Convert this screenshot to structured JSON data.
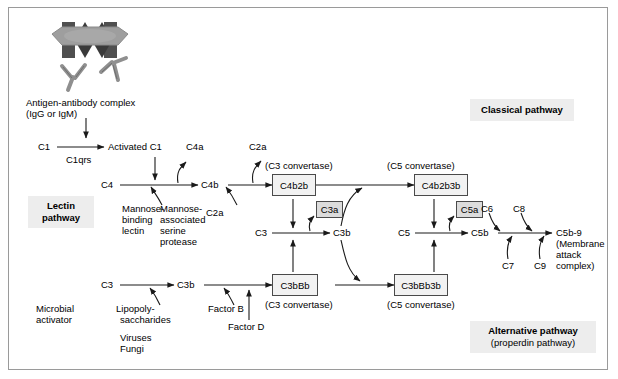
{
  "illustration": {
    "antigen_label": "antigen-bar",
    "antibody_label": "antibody-y-shape"
  },
  "classical": {
    "antigen_complex_line1": "Antigen-antibody complex",
    "antigen_complex_line2": "(IgG or IgM)",
    "c1": "C1",
    "c1qrs": "C1qrs",
    "activated_c1": "Activated C1",
    "c4": "C4",
    "c4a": "C4a",
    "c4b": "C4b",
    "c2a_up": "C2a",
    "c2a_in": "C2a",
    "c3_convertase_caption": "(C3 convertase)",
    "c4b2b": "C4b2b",
    "c5_convertase_caption": "(C5 convertase)",
    "c4b2b3b": "C4b2b3b",
    "pathway_label": "Classical pathway"
  },
  "lectin": {
    "pathway_line1": "Lectin",
    "pathway_line2": "pathway",
    "mbl_line1": "Mannose-",
    "mbl_line2": "binding",
    "mbl_line3": "lectin",
    "masp_line1": "Mannose-",
    "masp_line2": "associated",
    "masp_line3": "serine",
    "masp_line4": "protease"
  },
  "alternative": {
    "c3": "C3",
    "c3b": "C3b",
    "microbial_line1": "Microbial",
    "microbial_line2": "activator",
    "lps_line1": "Lipopoly-",
    "lps_line2": "saccharides",
    "viruses": "Viruses",
    "fungi": "Fungi",
    "factor_b": "Factor B",
    "factor_d": "Factor D",
    "c3bbb": "C3bBb",
    "c3_convertase_caption": "(C3 convertase)",
    "c3bbb3b": "C3bBb3b",
    "c5_convertase_caption": "(C5 convertase)",
    "pathway_line1": "Alternative pathway",
    "pathway_line2": "(properdin pathway)"
  },
  "central": {
    "c3": "C3",
    "c3a": "C3a",
    "c3b": "C3b",
    "c5": "C5",
    "c5a": "C5a",
    "c5b": "C5b"
  },
  "terminal": {
    "c6": "C6",
    "c7": "C7",
    "c8": "C8",
    "c9": "C9",
    "mac_line1": "C5b-9",
    "mac_line2": "(Membrane",
    "mac_line3": "attack",
    "mac_line4": "complex)"
  },
  "colors": {
    "border": "#9a9a9a",
    "box_fill": "#f2f2f2",
    "small_box_fill": "#dcdcdc",
    "pathway_fill": "#ededed",
    "line": "#1a1a1a",
    "antigen_fill": "#9e9e9e",
    "epitope_fill": "#4f4f4f"
  }
}
